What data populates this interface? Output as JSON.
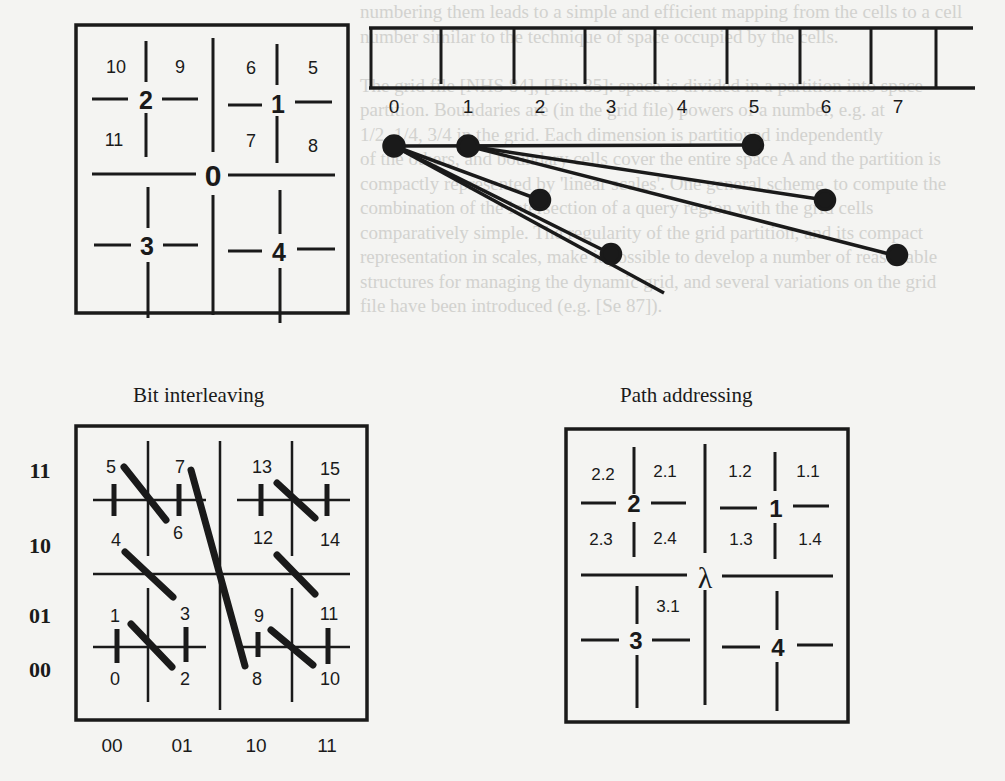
{
  "background_text": [
    "numbering them leads to a simple and efficient mapping from the cells to a cell",
    "number similar to the technique of space occupied by the cells.",
    "",
    "The grid file [NHS 84], [Hin 85]: space is divided in a partition into space",
    "partition. Boundaries are (in the grid file) powers of a number, e.g. at",
    "1/2, 1/4, 3/4 in the grid. Each dimension is partitioned independently",
    "of the others, and boundary cells cover the entire space A and the partition is",
    "compactly represented by 'linear scales'. One general scheme, to compute the",
    "combination of the intersection of a query region with the grid cells",
    "comparatively simple. The regularity of the grid partition, and its compact",
    "representation in scales, make it possible to develop a number of reasonable",
    "structures for managing the dynamic grid, and several variations on the grid",
    "file have been introduced (e.g. [Se 87])."
  ],
  "quadtree": {
    "root": "0",
    "quadrants": [
      "1",
      "2",
      "3",
      "4"
    ],
    "sub_1": [
      "5",
      "6",
      "7",
      "8"
    ],
    "sub_2": [
      "9",
      "10",
      "11"
    ]
  },
  "linear_array": {
    "indices": [
      "0",
      "1",
      "2",
      "3",
      "4",
      "5",
      "6",
      "7"
    ],
    "pointers": [
      {
        "from": "0",
        "to": "2.5"
      },
      {
        "from": "0",
        "to": "5"
      },
      {
        "from": "1",
        "to": "5.8"
      },
      {
        "from": "1",
        "to": "7"
      },
      {
        "from": "0",
        "to": "3.3"
      },
      {
        "from": "0",
        "to": "3.8"
      }
    ]
  },
  "bit_interleaving": {
    "caption": "Bit interleaving",
    "row_labels": [
      "11",
      "10",
      "01",
      "00"
    ],
    "col_labels": [
      "00",
      "01",
      "10",
      "11"
    ],
    "cells": [
      "0",
      "1",
      "2",
      "3",
      "4",
      "5",
      "6",
      "7",
      "8",
      "9",
      "10",
      "11",
      "12",
      "13",
      "14",
      "15"
    ]
  },
  "path_addressing": {
    "caption": "Path addressing",
    "root": "λ",
    "quadrants": [
      "1",
      "2",
      "3",
      "4"
    ],
    "sub_labels": {
      "q2": [
        "2.2",
        "2.1",
        "2.3",
        "2.4"
      ],
      "q1": [
        "1.2",
        "1.1",
        "1.3",
        "1.4"
      ],
      "q3": [
        "3.1"
      ]
    }
  }
}
